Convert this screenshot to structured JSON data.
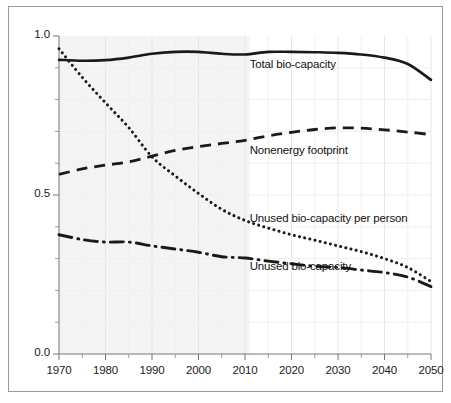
{
  "chart_data": {
    "type": "line",
    "title": "",
    "subtitle": "",
    "xlabel": "",
    "ylabel": "",
    "xlim": [
      1970,
      2050
    ],
    "ylim": [
      0.0,
      1.0
    ],
    "grid": true,
    "legend_position": "inline-annotations",
    "x_ticks": [
      1970,
      1980,
      1990,
      2000,
      2010,
      2020,
      2030,
      2040,
      2050
    ],
    "x_tick_labels": [
      "1970",
      "1980",
      "1990",
      "2000",
      "2010",
      "2020",
      "2030",
      "2040",
      "2050"
    ],
    "x_minor_ticks": [
      1975,
      1985,
      1995,
      2005,
      2015,
      2025,
      2035,
      2045
    ],
    "y_ticks": [
      0.0,
      0.5,
      1.0
    ],
    "y_tick_labels": [
      "0.0",
      "0.5",
      "1.0"
    ],
    "y_minor_ticks": [
      0.1,
      0.2,
      0.3,
      0.4,
      0.6,
      0.7,
      0.8,
      0.9
    ],
    "shaded_region": {
      "x_start": 1970,
      "x_end": 2011,
      "color": "#f4f4f4",
      "note": "historical period shading"
    },
    "x": [
      1970,
      1975,
      1980,
      1985,
      1990,
      1995,
      2000,
      2005,
      2010,
      2015,
      2020,
      2025,
      2030,
      2035,
      2040,
      2045,
      2050
    ],
    "series": [
      {
        "name": "Total bio-capacity",
        "style": "solid",
        "color": "#1a1a1a",
        "values": [
          0.925,
          0.922,
          0.924,
          0.932,
          0.944,
          0.95,
          0.95,
          0.944,
          0.942,
          0.95,
          0.95,
          0.949,
          0.947,
          0.942,
          0.932,
          0.912,
          0.862
        ],
        "label_x": 2011,
        "label_y": 0.905
      },
      {
        "name": "Nonenergy footprint",
        "style": "dashed",
        "color": "#1a1a1a",
        "values": [
          0.565,
          0.582,
          0.594,
          0.604,
          0.622,
          0.64,
          0.652,
          0.662,
          0.672,
          0.686,
          0.697,
          0.706,
          0.711,
          0.71,
          0.705,
          0.698,
          0.69
        ],
        "label_x": 2011,
        "label_y": 0.635
      },
      {
        "name": "Unused bio-capacity per person",
        "style": "dotted",
        "color": "#1a1a1a",
        "values": [
          0.96,
          0.87,
          0.79,
          0.712,
          0.62,
          0.56,
          0.505,
          0.455,
          0.42,
          0.396,
          0.375,
          0.358,
          0.34,
          0.322,
          0.3,
          0.272,
          0.228
        ],
        "label_x": 2011,
        "label_y": 0.42
      },
      {
        "name": "Unused  bio-capacity",
        "style": "dashdot",
        "color": "#1a1a1a",
        "values": [
          0.375,
          0.36,
          0.352,
          0.352,
          0.34,
          0.33,
          0.32,
          0.306,
          0.302,
          0.292,
          0.284,
          0.276,
          0.272,
          0.264,
          0.256,
          0.242,
          0.212
        ],
        "label_x": 2011,
        "label_y": 0.272
      }
    ]
  },
  "axes": {
    "y_labels": [
      "1.0",
      "0.5",
      "0.0"
    ],
    "x_labels": [
      "1970",
      "1980",
      "1990",
      "2000",
      "2010",
      "2020",
      "2030",
      "2040",
      "2050"
    ]
  },
  "annotations": [
    {
      "text": "Total bio-capacity"
    },
    {
      "text": "Nonenergy footprint"
    },
    {
      "text": "Unused bio-capacity per person"
    },
    {
      "text": "Unused  bio-capacity"
    }
  ]
}
